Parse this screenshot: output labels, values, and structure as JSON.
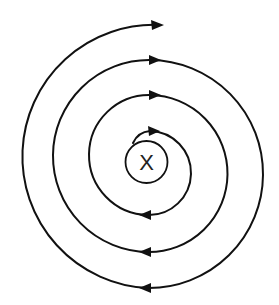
{
  "diagram": {
    "type": "spiral",
    "direction": "clockwise, outward",
    "center_label": "X",
    "colors": {
      "stroke": "#111111",
      "background": "#ffffff",
      "label": "#222222"
    },
    "turns": 3.5,
    "arrows": {
      "top_pointing_right": 4,
      "bottom_pointing_left": 3
    }
  }
}
